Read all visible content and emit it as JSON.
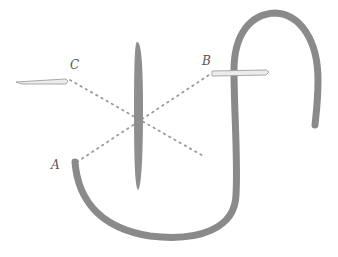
{
  "diagram": {
    "labels": {
      "a": "A",
      "b": "B",
      "c": "C"
    },
    "colors": {
      "stroke": "#8a8a8a",
      "dots": "#9a9a9a",
      "needle": "#a8a8a8",
      "background": "#ffffff"
    }
  }
}
